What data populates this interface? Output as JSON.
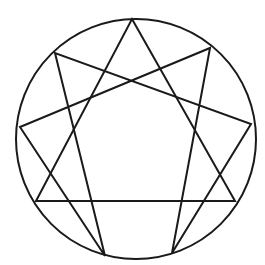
{
  "diagram": {
    "stroke_color": "#1a1a1a",
    "background": "#ffffff",
    "circle": {
      "cx": 136,
      "cy": 139,
      "r": 120
    },
    "points": {
      "9": [
        132,
        19
      ],
      "1": [
        210,
        48
      ],
      "2": [
        251,
        124
      ],
      "3": [
        235,
        201
      ],
      "4": [
        172,
        253
      ],
      "5": [
        105,
        256
      ],
      "6": [
        36,
        201
      ],
      "7": [
        20,
        127
      ],
      "8": [
        55,
        53
      ]
    },
    "triangle": [
      "9",
      "3",
      "6"
    ],
    "hexad": [
      "1",
      "4",
      "2",
      "8",
      "5",
      "7"
    ]
  }
}
